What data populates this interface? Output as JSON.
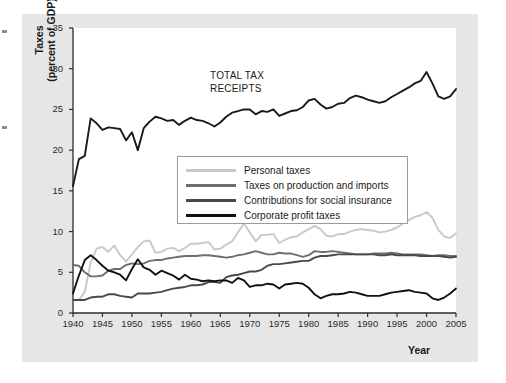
{
  "chart_data": {
    "type": "line",
    "title": "",
    "annotation": {
      "line1": "TOTAL TAX",
      "line2": "RECEIPTS"
    },
    "xlabel": "Year",
    "ylabel_line1": "Taxes",
    "ylabel_line2": "(percent of GDP)",
    "xlim": [
      1940,
      2005
    ],
    "ylim": [
      0,
      35
    ],
    "grid": false,
    "legend_position": "center",
    "xticks": [
      1940,
      1945,
      1950,
      1955,
      1960,
      1965,
      1970,
      1975,
      1980,
      1985,
      1990,
      1995,
      2000,
      2005
    ],
    "yticks": [
      0,
      5,
      10,
      15,
      20,
      25,
      30,
      35
    ],
    "colors": {
      "total": "#1a1a1a",
      "personal": "#c9c9c9",
      "production": "#6e6e6e",
      "social": "#4a4a4a",
      "corporate": "#111111",
      "panel": "#e6e6e6",
      "plot": "#ffffff"
    },
    "x": [
      1940,
      1941,
      1942,
      1943,
      1944,
      1945,
      1946,
      1947,
      1948,
      1949,
      1950,
      1951,
      1952,
      1953,
      1954,
      1955,
      1956,
      1957,
      1958,
      1959,
      1960,
      1961,
      1962,
      1963,
      1964,
      1965,
      1966,
      1967,
      1968,
      1969,
      1970,
      1971,
      1972,
      1973,
      1974,
      1975,
      1976,
      1977,
      1978,
      1979,
      1980,
      1981,
      1982,
      1983,
      1984,
      1985,
      1986,
      1987,
      1988,
      1989,
      1990,
      1991,
      1992,
      1993,
      1994,
      1995,
      1996,
      1997,
      1998,
      1999,
      2000,
      2001,
      2002,
      2003,
      2004,
      2005
    ],
    "series": [
      {
        "name": "TOTAL TAX RECEIPTS",
        "color": "#1a1a1a",
        "values": [
          15.6,
          18.9,
          19.3,
          23.9,
          23.3,
          22.5,
          22.8,
          22.7,
          22.6,
          21.2,
          22.2,
          20.0,
          22.7,
          23.5,
          24.1,
          23.9,
          23.6,
          23.7,
          23.1,
          23.6,
          24.0,
          23.7,
          23.6,
          23.3,
          22.9,
          23.4,
          24.1,
          24.6,
          24.8,
          25.0,
          25.0,
          24.4,
          24.8,
          24.7,
          25.0,
          24.2,
          24.5,
          24.8,
          24.9,
          25.3,
          26.1,
          26.3,
          25.6,
          25.1,
          25.3,
          25.7,
          25.8,
          26.4,
          26.7,
          26.5,
          26.2,
          26.0,
          25.8,
          26.0,
          26.5,
          26.9,
          27.3,
          27.7,
          28.2,
          28.5,
          29.6,
          28.2,
          26.6,
          26.3,
          26.6,
          27.5
        ]
      },
      {
        "name": "Personal taxes",
        "color": "#c9c9c9",
        "values": [
          1.6,
          1.6,
          2.6,
          6.2,
          7.9,
          8.1,
          7.5,
          8.3,
          7.1,
          6.3,
          7.2,
          8.1,
          8.8,
          8.9,
          7.4,
          7.5,
          7.9,
          8.0,
          7.6,
          8.0,
          8.5,
          8.5,
          8.6,
          8.7,
          7.8,
          7.9,
          8.4,
          8.8,
          9.9,
          11.0,
          9.9,
          8.8,
          9.6,
          9.6,
          9.7,
          8.6,
          9.0,
          9.3,
          9.4,
          9.9,
          10.3,
          10.7,
          10.3,
          9.5,
          9.4,
          9.7,
          9.7,
          10.0,
          10.2,
          10.3,
          10.2,
          10.1,
          9.9,
          10.0,
          10.2,
          10.5,
          11.0,
          11.4,
          11.8,
          12.0,
          12.4,
          11.7,
          10.2,
          9.4,
          9.2,
          9.8
        ]
      },
      {
        "name": "Taxes on production and imports",
        "color": "#6e6e6e",
        "values": [
          5.9,
          5.8,
          5.0,
          4.5,
          4.5,
          4.6,
          5.2,
          5.4,
          5.4,
          5.9,
          6.1,
          6.0,
          6.1,
          6.4,
          6.5,
          6.5,
          6.7,
          6.8,
          6.9,
          7.0,
          7.0,
          7.0,
          7.1,
          7.1,
          7.0,
          6.9,
          6.8,
          6.9,
          7.1,
          7.2,
          7.4,
          7.6,
          7.4,
          7.2,
          7.2,
          7.4,
          7.3,
          7.3,
          7.1,
          6.9,
          7.1,
          7.6,
          7.5,
          7.5,
          7.6,
          7.5,
          7.4,
          7.3,
          7.2,
          7.2,
          7.2,
          7.3,
          7.3,
          7.3,
          7.4,
          7.3,
          7.2,
          7.2,
          7.2,
          7.2,
          7.1,
          7.0,
          7.1,
          7.1,
          7.0,
          7.0
        ]
      },
      {
        "name": "Contributions for social insurance",
        "color": "#4a4a4a",
        "values": [
          1.6,
          1.6,
          1.6,
          1.9,
          2.0,
          2.0,
          2.3,
          2.3,
          2.1,
          2.0,
          1.9,
          2.4,
          2.4,
          2.4,
          2.5,
          2.6,
          2.8,
          3.0,
          3.1,
          3.2,
          3.4,
          3.4,
          3.5,
          3.8,
          3.8,
          3.7,
          4.4,
          4.6,
          4.7,
          4.9,
          5.1,
          5.1,
          5.3,
          5.8,
          6.0,
          6.0,
          6.1,
          6.2,
          6.3,
          6.4,
          6.4,
          6.8,
          7.0,
          7.0,
          7.1,
          7.2,
          7.2,
          7.2,
          7.2,
          7.2,
          7.2,
          7.2,
          7.1,
          7.1,
          7.2,
          7.1,
          7.1,
          7.1,
          7.1,
          7.0,
          7.0,
          7.0,
          7.0,
          6.9,
          6.8,
          6.9
        ]
      },
      {
        "name": "Corporate profit taxes",
        "color": "#111111",
        "values": [
          2.4,
          4.6,
          6.5,
          7.1,
          6.5,
          5.8,
          5.2,
          5.0,
          4.7,
          4.0,
          5.4,
          6.6,
          5.6,
          5.3,
          4.7,
          5.2,
          4.9,
          4.6,
          4.1,
          4.7,
          4.2,
          4.1,
          3.9,
          4.0,
          3.9,
          4.0,
          4.0,
          3.7,
          4.3,
          4.0,
          3.2,
          3.4,
          3.4,
          3.6,
          3.5,
          3.0,
          3.5,
          3.6,
          3.7,
          3.6,
          3.1,
          2.3,
          1.8,
          2.1,
          2.3,
          2.3,
          2.4,
          2.6,
          2.5,
          2.3,
          2.1,
          2.1,
          2.1,
          2.3,
          2.5,
          2.6,
          2.7,
          2.8,
          2.6,
          2.5,
          2.4,
          1.8,
          1.6,
          1.9,
          2.4,
          3.0
        ]
      }
    ],
    "legend": [
      {
        "label": "Personal taxes",
        "color": "#c9c9c9"
      },
      {
        "label": "Taxes on production and imports",
        "color": "#6e6e6e"
      },
      {
        "label": "Contributions for social insurance",
        "color": "#4a4a4a"
      },
      {
        "label": "Corporate profit taxes",
        "color": "#111111"
      }
    ]
  }
}
